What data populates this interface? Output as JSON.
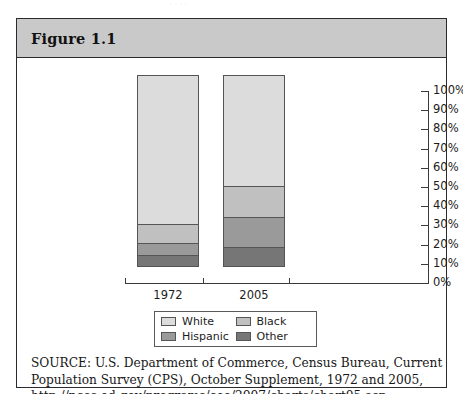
{
  "page": {
    "running_head_fragment": "·          ·   ·                    ·"
  },
  "figure": {
    "title": "Figure 1.1"
  },
  "legend": {
    "items": [
      {
        "label": "White",
        "color": "#dcdcdc"
      },
      {
        "label": "Black",
        "color": "#c0c0c0"
      },
      {
        "label": "Hispanic",
        "color": "#9a9a9a"
      },
      {
        "label": "Other",
        "color": "#767676"
      }
    ]
  },
  "source": {
    "line1": "SOURCE: U.S. Department of Commerce, Census Bureau, Current",
    "line2": "Population Survey (CPS), October Supplement, 1972 and 2005,",
    "line3": "http://nces.ed.gov/programs/coe/2007/charts/chart05.asp"
  },
  "chart_data": {
    "type": "bar",
    "title": "Figure 1.1",
    "xlabel": "",
    "ylabel": "",
    "stacked": true,
    "grid": false,
    "legend_position": "bottom",
    "ylim": [
      0,
      100
    ],
    "ytick_labels": [
      "100%",
      "90%",
      "80%",
      "70%",
      "60%",
      "50%",
      "40%",
      "30%",
      "20%",
      "10%",
      "0%"
    ],
    "ytick_values": [
      100,
      90,
      80,
      70,
      60,
      50,
      40,
      30,
      20,
      10,
      0
    ],
    "categories": [
      "1972",
      "2005"
    ],
    "series": [
      {
        "name": "White",
        "values": [
          78,
          58
        ],
        "color": "#dcdcdc"
      },
      {
        "name": "Black",
        "values": [
          10,
          16
        ],
        "color": "#c0c0c0"
      },
      {
        "name": "Hispanic",
        "values": [
          6,
          16
        ],
        "color": "#9a9a9a"
      },
      {
        "name": "Other",
        "values": [
          6,
          10
        ],
        "color": "#767676"
      }
    ]
  }
}
